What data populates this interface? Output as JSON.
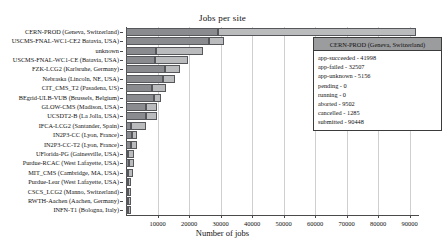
{
  "chart_data": {
    "type": "bar",
    "orientation": "horizontal",
    "stacked": true,
    "title": "Jobs per site",
    "xlabel": "Number of jobs",
    "ylabel": "",
    "xlim": [
      0,
      93000
    ],
    "grid": true,
    "xticks": [
      10000,
      20000,
      30000,
      40000,
      50000,
      60000,
      70000,
      80000,
      90000
    ],
    "xticklabels": [
      "10000",
      "20000",
      "30000",
      "40000",
      "50000",
      "60000",
      "70000",
      "80000",
      "90000"
    ],
    "categories": [
      "CERN-PROD (Geneva, Switzerland)",
      "USCMS-FNAL-WC1-CE2 Batavia, USA)",
      "unknown",
      "USCMS-FNAL-WC1-CE (Batavia, USA)",
      "FZK-LCG2 (Karlsruhe, Germany)",
      "Nebraska (Lincoln, NE, USA)",
      "CIT_CMS_T2 (Pasadena, US)",
      "BEgrid-ULB-VUB (Brussels, Belgium)",
      "GLOW-CMS (Madison, USA)",
      "UCSDT2-B (La Jolla, USA)",
      "IFCA-LCG2 (Santander, Spain)",
      "IN2P3-CC (Lyon, France)",
      "IN2P3-CC-T2 (Lyon, France)",
      "UFlorida-PG (Gainesville, USA)",
      "Purdue-RCAC (West Lafayette, USA)",
      "MIT_CMS (Cambridge, MA, USA)",
      "Purdue-Lear (West Lafayette, USA)",
      "CSCS_LCG2 (Manno, Switzerland)",
      "RWTH-Aachen (Aachen, Germany)",
      "INFN-T1 (Bologna, Italy)"
    ],
    "series": [
      {
        "name": "segment-1",
        "values": [
          29300,
          26200,
          9500,
          9200,
          12500,
          11600,
          8300,
          8800,
          6400,
          6200,
          1500,
          1900,
          1500,
          700,
          800,
          600,
          500,
          500,
          600,
          500
        ]
      },
      {
        "name": "segment-2",
        "values": [
          62800,
          4900,
          14800,
          10600,
          4800,
          4000,
          4300,
          2300,
          3300,
          3500,
          5000,
          1500,
          2000,
          1800,
          1800,
          1600,
          1200,
          1100,
          900,
          1000
        ]
      }
    ],
    "totals": [
      92100,
      31100,
      24300,
      19800,
      17300,
      15600,
      12600,
      11100,
      9700,
      9700,
      6500,
      3400,
      3500,
      2500,
      2600,
      2200,
      1700,
      1600,
      1500,
      1500
    ]
  },
  "tooltip": {
    "title": "CERN-PROD (Geneva, Switzerland)",
    "rows": [
      "app-succeeded - 41998",
      "app-failed - 32507",
      "app-unknown - 5156",
      "pending - 0",
      "running - 0",
      "aborted - 9502",
      "cancelled - 1285",
      "submitted - 90448"
    ]
  },
  "colors": {
    "segment_1": "#898b8e",
    "segment_2": "#b9bbbd",
    "axis": "#4a4a4a",
    "grid": "#cfcfcf",
    "tooltip_header_bg": "#9a9c9e",
    "tooltip_border": "#3b3b3b"
  }
}
